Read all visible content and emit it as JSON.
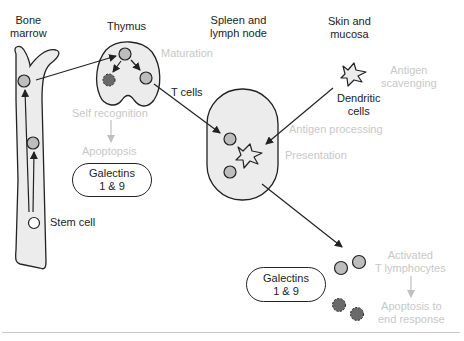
{
  "colors": {
    "outline": "#222222",
    "organ_fill": "#ececec",
    "tcell_fill": "#bdbdbd",
    "apoptotic_fill": "#6a6a6a",
    "process_text": "#c8c8c8",
    "process_arrow": "#c0c0c0"
  },
  "headers": {
    "bone_marrow": [
      "Bone",
      "marrow"
    ],
    "thymus": "Thymus",
    "spleen": [
      "Spleen and",
      "lymph node"
    ],
    "skin": [
      "Skin and",
      "mucosa"
    ]
  },
  "labels": {
    "stem_cell": "Stem cell",
    "t_cells": "T cells",
    "dendritic_cells": [
      "Dendritic",
      "cells"
    ]
  },
  "process_labels": {
    "maturation": "Maturation",
    "self_recognition": "Self recognition",
    "apoptopsis": "Apoptopsis",
    "antigen_scavenging": [
      "Antigen",
      "scavenging"
    ],
    "antigen_processing": "Antigen processing",
    "presentation": "Presentation",
    "activated_t_lymphocytes": [
      "Activated",
      "T lymphocytes"
    ],
    "apoptosis_end_response": [
      "Apoptosis to",
      "end response"
    ]
  },
  "galectin_boxes": [
    {
      "lines": [
        "Galectins",
        "1 & 9"
      ]
    },
    {
      "lines": [
        "Galectins",
        "1 & 9"
      ]
    }
  ]
}
